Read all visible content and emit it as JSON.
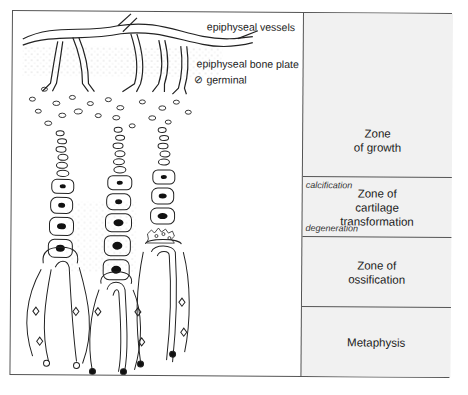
{
  "annotations": {
    "vessels": "epiphyseal vessels",
    "bone_plate": "epiphyseal bone plate",
    "germinal": "germinal",
    "germinal_symbol": "⊘"
  },
  "zones": [
    {
      "id": "growth",
      "label": "Zone\nof growth"
    },
    {
      "id": "cartilage",
      "label": "Zone of\ncartilage\ntransformation",
      "sub_top": "calcification",
      "sub_bottom": "degeneration"
    },
    {
      "id": "ossification",
      "label": "Zone of\nossification"
    },
    {
      "id": "metaphysis",
      "label": "Metaphysis"
    }
  ],
  "colors": {
    "line": "#222222",
    "zone_panel": "#f1f1f1",
    "frame": "#555555"
  }
}
